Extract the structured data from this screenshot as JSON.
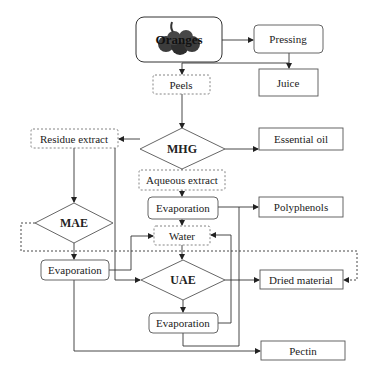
{
  "diagram": {
    "type": "flowchart",
    "nodes": {
      "oranges": {
        "label": "Oranges",
        "shape": "rounded-rect-image"
      },
      "pressing": {
        "label": "Pressing",
        "shape": "rounded-rect"
      },
      "juice": {
        "label": "Juice",
        "shape": "rect"
      },
      "peels": {
        "label": "Peels",
        "shape": "dashed-rect"
      },
      "mhg": {
        "label": "MHG",
        "shape": "diamond"
      },
      "essential_oil": {
        "label": "Essential oil",
        "shape": "rect"
      },
      "residue_extract": {
        "label": "Residue extract",
        "shape": "dashed-rect"
      },
      "aqueous_extract": {
        "label": "Aqueous extract",
        "shape": "dashed-rect"
      },
      "evaporation_1": {
        "label": "Evaporation",
        "shape": "rounded-rect"
      },
      "polyphenols": {
        "label": "Polyphenols",
        "shape": "rect"
      },
      "mae": {
        "label": "MAE",
        "shape": "diamond"
      },
      "water": {
        "label": "Water",
        "shape": "dashed-rect"
      },
      "evaporation_2": {
        "label": "Evaporation",
        "shape": "rounded-rect"
      },
      "uae": {
        "label": "UAE",
        "shape": "diamond"
      },
      "dried_material": {
        "label": "Dried material",
        "shape": "rect"
      },
      "evaporation_3": {
        "label": "Evaporation",
        "shape": "rounded-rect"
      },
      "pectin": {
        "label": "Pectin",
        "shape": "rect"
      }
    },
    "edges": [
      {
        "from": "oranges",
        "to": "pressing"
      },
      {
        "from": "pressing",
        "to": "juice"
      },
      {
        "from": "pressing",
        "to": "peels"
      },
      {
        "from": "peels",
        "to": "mhg"
      },
      {
        "from": "mhg",
        "to": "essential_oil"
      },
      {
        "from": "mhg",
        "to": "residue_extract"
      },
      {
        "from": "mhg",
        "to": "aqueous_extract"
      },
      {
        "from": "aqueous_extract",
        "to": "evaporation_1"
      },
      {
        "from": "evaporation_1",
        "to": "polyphenols"
      },
      {
        "from": "evaporation_1",
        "to": "water"
      },
      {
        "from": "residue_extract",
        "to": "mae"
      },
      {
        "from": "residue_extract",
        "to": "uae"
      },
      {
        "from": "mae",
        "to": "evaporation_2"
      },
      {
        "from": "mae",
        "to": "dried_material",
        "style": "dashed"
      },
      {
        "from": "evaporation_2",
        "to": "water"
      },
      {
        "from": "evaporation_2",
        "to": "pectin"
      },
      {
        "from": "water",
        "to": "uae"
      },
      {
        "from": "uae",
        "to": "dried_material"
      },
      {
        "from": "uae",
        "to": "evaporation_3"
      },
      {
        "from": "evaporation_3",
        "to": "water"
      },
      {
        "from": "evaporation_3",
        "to": "pectin"
      }
    ],
    "colors": {
      "line": "#333333",
      "dashed_border": "#666666",
      "orange_fruit": "#3a3a3a",
      "text": "#222222"
    }
  }
}
